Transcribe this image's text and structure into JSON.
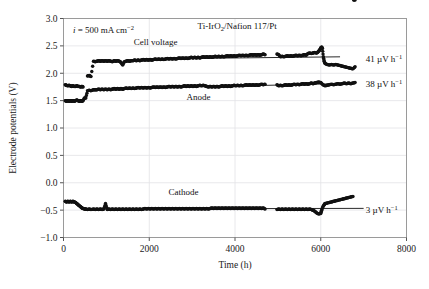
{
  "chart_data": {
    "type": "scatter",
    "title": "Ti-IrO2/Nafion 117/Pt",
    "title_parts": {
      "pre": "Ti-IrO",
      "sub": "2",
      "post": "/Nafion 117/Pt"
    },
    "xlabel": "Time (h)",
    "ylabel": "Electrode potentials (V)",
    "xlim": [
      0,
      8000
    ],
    "ylim": [
      -1.0,
      3.0
    ],
    "xticks": [
      0,
      2000,
      4000,
      6000,
      8000
    ],
    "xticklabels": [
      "0",
      "2000",
      "4000",
      "6000",
      "8000"
    ],
    "yticks": [
      -1.0,
      -0.5,
      0.0,
      0.5,
      1.0,
      1.5,
      2.0,
      2.5,
      3.0
    ],
    "yticklabels": [
      "-1.0",
      "-0.5",
      "0.0",
      "0.5",
      "1.0",
      "1.5",
      "2.0",
      "2.5",
      "3.0"
    ],
    "grid": true,
    "marker": "filled-circle",
    "marker_color": "#111111",
    "current_density": {
      "symbol": "i",
      "equals": "=",
      "value": "500 mA cm",
      "exponent": "-2"
    },
    "series": [
      {
        "name": "Cell voltage",
        "label": "Cell voltage",
        "label_xy": [
          2150,
          2.52
        ],
        "degradation_rate": "41 µV h",
        "degradation_exponent": "−1",
        "rate_label_xy": [
          7050,
          2.26
        ],
        "trendline": {
          "x": [
            3450,
            6450
          ],
          "y": [
            2.275,
            2.3
          ]
        },
        "points_x": [
          40,
          70,
          100,
          130,
          160,
          190,
          220,
          250,
          280,
          310,
          340,
          370,
          400,
          430,
          455,
          560,
          600,
          640,
          700,
          740,
          780,
          820,
          860,
          900,
          940,
          980,
          1020,
          1060,
          1100,
          1140,
          1180,
          1220,
          1260,
          1300,
          1340,
          1380,
          1420,
          1460,
          1500,
          1540,
          1580,
          1620,
          1660,
          1700,
          1740,
          1780,
          1820,
          1860,
          1900,
          1940,
          1980,
          2020,
          2060,
          2100,
          2140,
          2180,
          2220,
          2260,
          2300,
          2340,
          2380,
          2420,
          2460,
          2500,
          2540,
          2580,
          2620,
          2660,
          2700,
          2740,
          2780,
          2820,
          2860,
          2900,
          2940,
          2980,
          3020,
          3060,
          3100,
          3140,
          3180,
          3220,
          3260,
          3300,
          3340,
          3380,
          3420,
          3460,
          3500,
          3540,
          3580,
          3620,
          3660,
          3700,
          3740,
          3780,
          3820,
          3860,
          3900,
          3940,
          3980,
          4020,
          4060,
          4100,
          4140,
          4180,
          4220,
          4260,
          4300,
          4340,
          4380,
          4420,
          4460,
          4500,
          4540,
          4580,
          4620,
          4660,
          4700,
          4980,
          5020,
          5060,
          5100,
          5140,
          5180,
          5220,
          5260,
          5300,
          5340,
          5380,
          5420,
          5460,
          5500,
          5540,
          5580,
          5620,
          5660,
          5700,
          5740,
          5780,
          5820,
          5860,
          5900,
          5920,
          5950,
          5980,
          6000,
          6020,
          6040,
          6060,
          6080,
          6100,
          6150,
          6200,
          6250,
          6300,
          6350,
          6400,
          6450,
          6500,
          6550,
          6600,
          6650,
          6700,
          6750,
          6800
        ],
        "points_y": [
          1.79,
          1.78,
          1.77,
          1.78,
          1.77,
          1.76,
          1.77,
          1.76,
          1.76,
          1.77,
          1.76,
          1.76,
          1.75,
          1.76,
          1.75,
          1.95,
          1.96,
          1.94,
          2.22,
          2.21,
          2.22,
          2.23,
          2.22,
          2.23,
          2.22,
          2.23,
          2.22,
          2.23,
          2.22,
          2.21,
          2.23,
          2.22,
          2.23,
          2.22,
          2.2,
          2.15,
          2.21,
          2.22,
          2.23,
          2.22,
          2.23,
          2.23,
          2.24,
          2.23,
          2.24,
          2.23,
          2.24,
          2.25,
          2.24,
          2.25,
          2.24,
          2.25,
          2.24,
          2.25,
          2.26,
          2.25,
          2.26,
          2.25,
          2.26,
          2.25,
          2.26,
          2.27,
          2.26,
          2.27,
          2.26,
          2.27,
          2.26,
          2.27,
          2.28,
          2.27,
          2.28,
          2.27,
          2.28,
          2.27,
          2.28,
          2.29,
          2.28,
          2.29,
          2.28,
          2.29,
          2.28,
          2.29,
          2.3,
          2.29,
          2.3,
          2.29,
          2.3,
          2.29,
          2.3,
          2.31,
          2.3,
          2.31,
          2.3,
          2.31,
          2.3,
          2.31,
          2.32,
          2.31,
          2.32,
          2.31,
          2.32,
          2.31,
          2.32,
          2.33,
          2.32,
          2.33,
          2.32,
          2.33,
          2.32,
          2.33,
          2.34,
          2.33,
          2.34,
          2.33,
          2.34,
          2.33,
          2.34,
          2.35,
          2.34,
          2.35,
          2.34,
          2.3,
          2.31,
          2.3,
          2.31,
          2.32,
          2.31,
          2.32,
          2.31,
          2.32,
          2.33,
          2.32,
          2.33,
          2.32,
          2.33,
          2.34,
          2.33,
          2.36,
          2.37,
          2.36,
          2.37,
          2.38,
          2.37,
          2.38,
          2.4,
          2.43,
          2.46,
          2.48,
          2.45,
          2.3,
          2.22,
          2.18,
          2.16,
          2.15,
          2.16,
          2.15,
          2.16,
          2.15,
          2.14,
          2.13,
          2.12,
          2.11,
          2.1,
          2.09,
          2.08,
          2.12,
          2.15,
          2.14,
          2.16
        ]
      },
      {
        "name": "Anode",
        "label": "Anode",
        "label_xy": [
          3150,
          1.52
        ],
        "degradation_rate": "38 µV h",
        "degradation_exponent": "−1",
        "rate_label_xy": [
          7050,
          1.8
        ],
        "trendline": {
          "x": [
            3400,
            6700
          ],
          "y": [
            1.755,
            1.815
          ]
        },
        "points_x": [
          40,
          70,
          100,
          130,
          160,
          190,
          220,
          250,
          280,
          310,
          340,
          370,
          400,
          430,
          455,
          490,
          520,
          560,
          600,
          640,
          700,
          740,
          780,
          820,
          860,
          900,
          940,
          980,
          1020,
          1060,
          1100,
          1140,
          1180,
          1220,
          1260,
          1300,
          1340,
          1380,
          1420,
          1460,
          1500,
          1540,
          1580,
          1620,
          1660,
          1700,
          1740,
          1780,
          1820,
          1860,
          1900,
          1940,
          1980,
          2020,
          2060,
          2100,
          2140,
          2180,
          2220,
          2260,
          2300,
          2340,
          2380,
          2420,
          2460,
          2500,
          2540,
          2580,
          2620,
          2660,
          2700,
          2740,
          2780,
          2820,
          2860,
          2900,
          2940,
          2980,
          3020,
          3060,
          3100,
          3140,
          3180,
          3220,
          3260,
          3300,
          3340,
          3380,
          3420,
          3460,
          3500,
          3540,
          3580,
          3620,
          3660,
          3700,
          3740,
          3780,
          3820,
          3860,
          3900,
          3940,
          3980,
          4020,
          4060,
          4100,
          4140,
          4180,
          4220,
          4260,
          4300,
          4340,
          4380,
          4420,
          4460,
          4500,
          4540,
          4580,
          4620,
          4660,
          4700,
          4980,
          5020,
          5060,
          5100,
          5140,
          5180,
          5220,
          5260,
          5300,
          5340,
          5380,
          5420,
          5460,
          5500,
          5540,
          5580,
          5620,
          5660,
          5700,
          5740,
          5780,
          5820,
          5860,
          5900,
          5950,
          6000,
          6050,
          6100,
          6150,
          6200,
          6250,
          6300,
          6350,
          6400,
          6450,
          6500,
          6550,
          6600,
          6650,
          6700,
          6750,
          6800
        ],
        "points_y": [
          1.5,
          1.49,
          1.5,
          1.49,
          1.5,
          1.49,
          1.5,
          1.49,
          1.5,
          1.51,
          1.5,
          1.49,
          1.5,
          1.49,
          1.5,
          1.55,
          1.55,
          1.68,
          1.69,
          1.68,
          1.7,
          1.7,
          1.7,
          1.71,
          1.7,
          1.71,
          1.7,
          1.71,
          1.7,
          1.71,
          1.7,
          1.71,
          1.72,
          1.71,
          1.72,
          1.71,
          1.72,
          1.71,
          1.72,
          1.73,
          1.72,
          1.73,
          1.72,
          1.73,
          1.72,
          1.73,
          1.74,
          1.73,
          1.74,
          1.73,
          1.74,
          1.73,
          1.74,
          1.73,
          1.74,
          1.75,
          1.74,
          1.75,
          1.74,
          1.75,
          1.74,
          1.75,
          1.74,
          1.75,
          1.76,
          1.75,
          1.76,
          1.75,
          1.76,
          1.75,
          1.76,
          1.75,
          1.76,
          1.77,
          1.76,
          1.77,
          1.76,
          1.77,
          1.76,
          1.77,
          1.76,
          1.77,
          1.78,
          1.77,
          1.78,
          1.77,
          1.76,
          1.75,
          1.76,
          1.75,
          1.76,
          1.75,
          1.76,
          1.75,
          1.76,
          1.77,
          1.76,
          1.77,
          1.76,
          1.77,
          1.76,
          1.77,
          1.78,
          1.77,
          1.78,
          1.77,
          1.78,
          1.77,
          1.78,
          1.79,
          1.78,
          1.79,
          1.78,
          1.79,
          1.78,
          1.79,
          1.78,
          1.79,
          1.8,
          1.79,
          1.8,
          1.79,
          1.77,
          1.78,
          1.77,
          1.78,
          1.79,
          1.78,
          1.79,
          1.78,
          1.79,
          1.8,
          1.79,
          1.8,
          1.79,
          1.8,
          1.81,
          1.8,
          1.81,
          1.8,
          1.81,
          1.82,
          1.81,
          1.82,
          1.83,
          1.84,
          1.83,
          1.79,
          1.77,
          1.78,
          1.79,
          1.8,
          1.79,
          1.8,
          1.81,
          1.8,
          1.81,
          1.82,
          1.81,
          1.82,
          1.81,
          1.82,
          1.83,
          1.82,
          1.83
        ]
      },
      {
        "name": "Cathode",
        "label": "Cathode",
        "label_xy": [
          2800,
          -0.22
        ],
        "degradation_rate": "3 µV h",
        "degradation_exponent": "−1",
        "rate_label_xy": [
          7050,
          -0.5
        ],
        "trendline": {
          "x": [
            850,
            7000
          ],
          "y": [
            -0.478,
            -0.468
          ]
        },
        "points_x": [
          40,
          70,
          100,
          130,
          160,
          190,
          220,
          250,
          280,
          310,
          340,
          370,
          400,
          430,
          455,
          490,
          520,
          560,
          600,
          640,
          700,
          740,
          780,
          820,
          860,
          900,
          940,
          980,
          1020,
          1060,
          1100,
          1140,
          1180,
          1220,
          1260,
          1300,
          1340,
          1380,
          1420,
          1460,
          1500,
          1540,
          1580,
          1620,
          1660,
          1700,
          1740,
          1780,
          1820,
          1860,
          1900,
          1940,
          1980,
          2020,
          2060,
          2100,
          2140,
          2180,
          2220,
          2260,
          2300,
          2340,
          2380,
          2420,
          2460,
          2500,
          2540,
          2580,
          2620,
          2660,
          2700,
          2740,
          2780,
          2820,
          2860,
          2900,
          2940,
          2980,
          3020,
          3060,
          3100,
          3140,
          3180,
          3220,
          3260,
          3300,
          3340,
          3380,
          3420,
          3460,
          3500,
          3540,
          3580,
          3620,
          3660,
          3700,
          3740,
          3780,
          3820,
          3860,
          3900,
          3940,
          3980,
          4020,
          4060,
          4100,
          4140,
          4180,
          4220,
          4260,
          4300,
          4340,
          4380,
          4420,
          4460,
          4500,
          4540,
          4580,
          4620,
          4660,
          4700,
          4980,
          5020,
          5060,
          5100,
          5140,
          5180,
          5220,
          5260,
          5300,
          5340,
          5380,
          5420,
          5460,
          5500,
          5540,
          5580,
          5620,
          5660,
          5700,
          5740,
          5780,
          5820,
          5860,
          5900,
          5950,
          6000,
          6020,
          6050,
          6080,
          6100,
          6150,
          6200,
          6250,
          6300,
          6350,
          6400,
          6450,
          6500,
          6550,
          6600,
          6650,
          6700,
          6750,
          6800
        ],
        "points_y": [
          -0.34,
          -0.35,
          -0.34,
          -0.35,
          -0.34,
          -0.35,
          -0.34,
          -0.35,
          -0.36,
          -0.38,
          -0.4,
          -0.42,
          -0.44,
          -0.46,
          -0.47,
          -0.48,
          -0.48,
          -0.49,
          -0.48,
          -0.49,
          -0.48,
          -0.49,
          -0.48,
          -0.49,
          -0.48,
          -0.49,
          -0.48,
          -0.38,
          -0.49,
          -0.48,
          -0.49,
          -0.48,
          -0.49,
          -0.48,
          -0.49,
          -0.48,
          -0.49,
          -0.48,
          -0.49,
          -0.48,
          -0.49,
          -0.48,
          -0.49,
          -0.48,
          -0.49,
          -0.48,
          -0.49,
          -0.48,
          -0.49,
          -0.48,
          -0.47,
          -0.48,
          -0.47,
          -0.48,
          -0.47,
          -0.48,
          -0.47,
          -0.48,
          -0.47,
          -0.48,
          -0.47,
          -0.48,
          -0.47,
          -0.48,
          -0.47,
          -0.48,
          -0.47,
          -0.48,
          -0.47,
          -0.48,
          -0.47,
          -0.48,
          -0.47,
          -0.48,
          -0.47,
          -0.48,
          -0.47,
          -0.48,
          -0.47,
          -0.48,
          -0.47,
          -0.48,
          -0.47,
          -0.48,
          -0.47,
          -0.48,
          -0.47,
          -0.48,
          -0.47,
          -0.46,
          -0.47,
          -0.46,
          -0.47,
          -0.46,
          -0.47,
          -0.46,
          -0.47,
          -0.46,
          -0.47,
          -0.46,
          -0.47,
          -0.46,
          -0.47,
          -0.46,
          -0.47,
          -0.46,
          -0.47,
          -0.46,
          -0.47,
          -0.46,
          -0.47,
          -0.46,
          -0.47,
          -0.46,
          -0.47,
          -0.46,
          -0.47,
          -0.46,
          -0.47,
          -0.46,
          -0.48,
          -0.49,
          -0.48,
          -0.49,
          -0.48,
          -0.49,
          -0.48,
          -0.49,
          -0.48,
          -0.49,
          -0.48,
          -0.49,
          -0.48,
          -0.49,
          -0.48,
          -0.49,
          -0.48,
          -0.49,
          -0.48,
          -0.49,
          -0.48,
          -0.49,
          -0.5,
          -0.52,
          -0.55,
          -0.57,
          -0.56,
          -0.5,
          -0.44,
          -0.4,
          -0.38,
          -0.37,
          -0.36,
          -0.35,
          -0.34,
          -0.33,
          -0.32,
          -0.31,
          -0.3,
          -0.29,
          -0.28,
          -0.27,
          -0.26,
          -0.25
        ]
      }
    ]
  }
}
